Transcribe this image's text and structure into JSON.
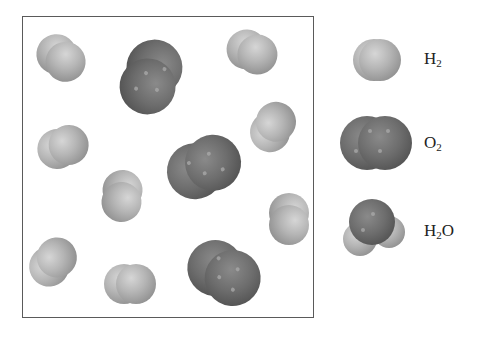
{
  "figure": {
    "title": "",
    "box": {
      "description": "Container with mixture of H2 and O2 molecules"
    },
    "molecules_in_box": [
      {
        "type": "H2",
        "x": 61,
        "y": 58,
        "angle": 40
      },
      {
        "type": "O2",
        "x": 151,
        "y": 77,
        "angle": 110
      },
      {
        "type": "H2",
        "x": 252,
        "y": 52,
        "angle": 25
      },
      {
        "type": "H2",
        "x": 63,
        "y": 147,
        "angle": -20
      },
      {
        "type": "H2",
        "x": 273,
        "y": 127,
        "angle": -60
      },
      {
        "type": "O2",
        "x": 204,
        "y": 167,
        "angle": -25
      },
      {
        "type": "H2",
        "x": 122,
        "y": 196,
        "angle": 95
      },
      {
        "type": "H2",
        "x": 289,
        "y": 219,
        "angle": 90
      },
      {
        "type": "H2",
        "x": 53,
        "y": 262,
        "angle": -50
      },
      {
        "type": "H2",
        "x": 130,
        "y": 284,
        "angle": 0
      },
      {
        "type": "O2",
        "x": 224,
        "y": 273,
        "angle": 30
      }
    ],
    "counts": {
      "H2": 8,
      "O2": 3,
      "H2O": 0
    }
  },
  "legend": {
    "items": [
      {
        "id": "h2",
        "formula_main": "H",
        "formula_sub": "2",
        "formula_tail": "",
        "name": "H2"
      },
      {
        "id": "o2",
        "formula_main": "O",
        "formula_sub": "2",
        "formula_tail": "",
        "name": "O2"
      },
      {
        "id": "h2o",
        "formula_main": "H",
        "formula_sub": "2",
        "formula_tail": "O",
        "name": "H2O"
      }
    ]
  },
  "colors": {
    "hydrogen": "#b5b5b5",
    "oxygen": "#6d6d6d",
    "border": "#5a5a5a"
  }
}
